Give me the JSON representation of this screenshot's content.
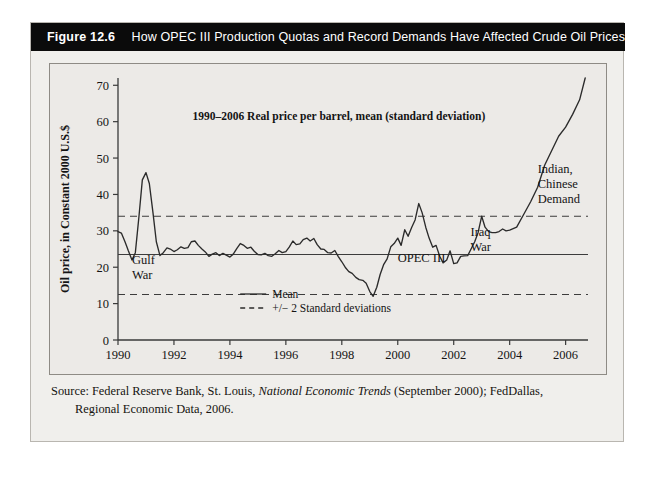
{
  "figure": {
    "number": "Figure 12.6",
    "caption": "How OPEC III Production Quotas and Record Demands Have Affected Crude Oil Prices"
  },
  "source": {
    "prefix": "Source: Federal Reserve Bank, St. Louis, ",
    "italic_title": "National Economic Trends",
    "suffix": " (September 2000); FedDallas,",
    "line2": "Regional Economic Data, 2006."
  },
  "chart_data": {
    "type": "line",
    "title": "1990–2006 Real price per barrel, mean (standard deviation)",
    "xlabel": "",
    "ylabel": "Oil price, in Constant 2000 U.S.$",
    "xlim": [
      1990,
      2006.8
    ],
    "ylim": [
      0,
      72
    ],
    "grid": false,
    "legend_position": "inside-bottom-center",
    "xticks": [
      1990,
      1992,
      1994,
      1996,
      1998,
      2000,
      2002,
      2004,
      2006
    ],
    "xticklabels": [
      "1990",
      "1992",
      "1994",
      "1996",
      "1998",
      "2000",
      "2002",
      "2004",
      "2006"
    ],
    "yticks": [
      0,
      10,
      20,
      30,
      40,
      50,
      60,
      70
    ],
    "yticklabels": [
      "0",
      "10",
      "20",
      "30",
      "40",
      "50",
      "60",
      "70"
    ],
    "reference_lines": [
      {
        "name": "mean",
        "label": "Mean",
        "value": 23.5,
        "style": "solid"
      },
      {
        "name": "upper_band",
        "label": "+2 Standard deviations",
        "value": 34.0,
        "style": "dashed"
      },
      {
        "name": "lower_band",
        "label": "-2 Standard deviations",
        "value": 12.5,
        "style": "dashed"
      }
    ],
    "legend": [
      {
        "label": "Mean",
        "style": "solid"
      },
      {
        "label": "+/− 2 Standard deviations",
        "style": "dashed"
      }
    ],
    "annotations": [
      {
        "name": "gulf-war",
        "text_lines": [
          "Gulf",
          "War"
        ],
        "x": 1990.5,
        "y": 21.0
      },
      {
        "name": "opec-iii",
        "text_lines": [
          "OPEC III"
        ],
        "x": 2000.0,
        "y": 21.5
      },
      {
        "name": "iraq-war",
        "text_lines": [
          "Iraq",
          "War"
        ],
        "x": 2002.6,
        "y": 28.5
      },
      {
        "name": "indian-chinese-demand",
        "text_lines": [
          "Indian,",
          "Chinese",
          "Demand"
        ],
        "x": 2005.0,
        "y": 46.0
      }
    ],
    "series": [
      {
        "name": "Mean real oil price per barrel",
        "style": "solid",
        "color": "#2b2b2b",
        "x": [
          1990.0,
          1990.12,
          1990.25,
          1990.37,
          1990.5,
          1990.62,
          1990.75,
          1990.87,
          1991.0,
          1991.12,
          1991.25,
          1991.37,
          1991.5,
          1991.62,
          1991.75,
          1991.87,
          1992.0,
          1992.12,
          1992.25,
          1992.37,
          1992.5,
          1992.62,
          1992.75,
          1992.87,
          1993.0,
          1993.12,
          1993.25,
          1993.37,
          1993.5,
          1993.62,
          1993.75,
          1993.87,
          1994.0,
          1994.12,
          1994.25,
          1994.37,
          1994.5,
          1994.62,
          1994.75,
          1994.87,
          1995.0,
          1995.12,
          1995.25,
          1995.37,
          1995.5,
          1995.62,
          1995.75,
          1995.87,
          1996.0,
          1996.12,
          1996.25,
          1996.37,
          1996.5,
          1996.62,
          1996.75,
          1996.87,
          1997.0,
          1997.12,
          1997.25,
          1997.37,
          1997.5,
          1997.62,
          1997.75,
          1997.87,
          1998.0,
          1998.12,
          1998.25,
          1998.37,
          1998.5,
          1998.62,
          1998.75,
          1998.87,
          1999.0,
          1999.12,
          1999.25,
          1999.37,
          1999.5,
          1999.62,
          1999.75,
          1999.87,
          2000.0,
          2000.12,
          2000.25,
          2000.37,
          2000.5,
          2000.62,
          2000.75,
          2000.87,
          2001.0,
          2001.12,
          2001.25,
          2001.37,
          2001.5,
          2001.62,
          2001.75,
          2001.87,
          2002.0,
          2002.12,
          2002.25,
          2002.37,
          2002.5,
          2002.62,
          2002.75,
          2002.87,
          2003.0,
          2003.12,
          2003.25,
          2003.37,
          2003.5,
          2003.62,
          2003.75,
          2003.87,
          2004.0,
          2004.25,
          2004.5,
          2004.75,
          2005.0,
          2005.25,
          2005.5,
          2005.75,
          2006.0,
          2006.25,
          2006.5,
          2006.7
        ],
        "y": [
          29.8,
          29.4,
          27.0,
          24.5,
          22.0,
          24.0,
          34.0,
          44.0,
          46.0,
          43.0,
          35.0,
          27.0,
          23.2,
          24.0,
          25.3,
          25.0,
          24.3,
          24.8,
          25.6,
          25.2,
          25.4,
          27.0,
          27.2,
          26.0,
          25.0,
          24.2,
          23.0,
          23.6,
          24.0,
          23.2,
          23.8,
          23.3,
          22.8,
          23.6,
          25.2,
          26.5,
          26.0,
          25.2,
          25.5,
          24.4,
          23.5,
          23.4,
          23.8,
          23.2,
          23.0,
          23.7,
          24.6,
          24.0,
          24.3,
          25.5,
          27.2,
          26.2,
          26.4,
          27.6,
          28.0,
          27.2,
          27.9,
          26.2,
          25.0,
          24.9,
          24.0,
          23.9,
          24.6,
          23.0,
          21.5,
          20.0,
          18.8,
          18.3,
          17.2,
          16.6,
          16.4,
          15.6,
          13.3,
          12.0,
          14.5,
          18.0,
          20.8,
          22.3,
          25.6,
          26.5,
          28.0,
          26.0,
          30.3,
          28.5,
          31.0,
          33.0,
          37.5,
          35.0,
          31.0,
          28.0,
          25.5,
          26.0,
          23.0,
          21.2,
          22.0,
          24.5,
          21.0,
          21.2,
          23.0,
          23.1,
          23.2,
          25.0,
          27.0,
          29.5,
          34.0,
          31.0,
          29.8,
          29.5,
          29.5,
          29.8,
          30.5,
          30.0,
          30.2,
          31.0,
          34.5,
          38.0,
          42.0,
          48.0,
          52.0,
          56.0,
          58.5,
          62.0,
          66.0,
          72.0
        ]
      }
    ]
  }
}
